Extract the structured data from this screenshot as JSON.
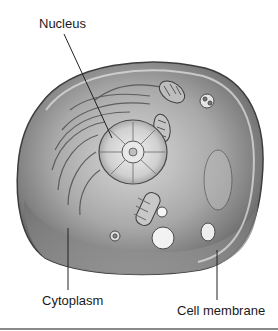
{
  "diagram": {
    "labels": [
      {
        "id": "nucleus",
        "text": "Nucleus"
      },
      {
        "id": "cytoplasm",
        "text": "Cytoplasm"
      },
      {
        "id": "cell_membrane",
        "text": "Cell membrane"
      }
    ]
  }
}
